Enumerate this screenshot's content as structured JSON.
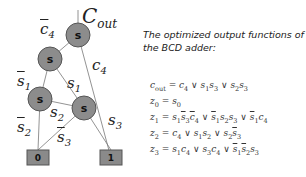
{
  "diagram": {
    "root_label": "C",
    "root_label_sub": "out",
    "node_label": "s",
    "terminals": [
      "0",
      "1"
    ],
    "edge_labels": {
      "c4_bar": {
        "var": "c",
        "sub": "4",
        "negated": true
      },
      "c4": {
        "var": "c",
        "sub": "4",
        "negated": false
      },
      "s1_bar": {
        "var": "s",
        "sub": "1",
        "negated": true
      },
      "s1": {
        "var": "s",
        "sub": "1",
        "negated": false
      },
      "s2": {
        "var": "s",
        "sub": "2",
        "negated": false
      },
      "s2_bar": {
        "var": "s",
        "sub": "2",
        "negated": true
      },
      "s3_bar": {
        "var": "s",
        "sub": "3",
        "negated": true
      },
      "s3": {
        "var": "s",
        "sub": "3",
        "negated": false
      }
    },
    "colors": {
      "node_fill": "#8c8c8c",
      "terminal_fill": "#8a8a8a",
      "edge": "#666666"
    }
  },
  "caption": "The optimized output functions of the BCD adder:",
  "equations": [
    {
      "lhs": "c_out",
      "rhs": "c4 ∨ s1s3 ∨ s2s3"
    },
    {
      "lhs": "z0",
      "rhs": "s0"
    },
    {
      "lhs": "z1",
      "rhs": "s1 s̄3 c̄4 ∨ s̄1 s2 s3 ∨ s̄1 c4"
    },
    {
      "lhs": "z2",
      "rhs": "c4 ∨ s1 s2 ∨ s2 s̄3"
    },
    {
      "lhs": "z3",
      "rhs": "s1 c4 ∨ s3 c4 ∨ s̄1 s̄2 s3"
    }
  ]
}
